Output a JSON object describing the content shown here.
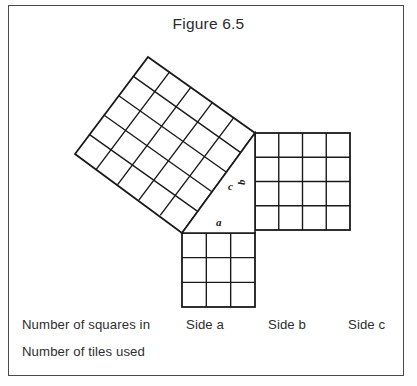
{
  "figure": {
    "title": "Figure 6.5",
    "border_color": "#4a4a4a",
    "line_color": "#1a1a1a",
    "background": "#ffffff"
  },
  "diagram": {
    "triangle_labels": {
      "a": "a",
      "b": "b",
      "c": "c"
    },
    "squares": [
      {
        "name": "square-a",
        "side_label": "a",
        "grid": 3,
        "tiles": 9,
        "orientation": "axis-aligned",
        "position": "below triangle"
      },
      {
        "name": "square-b",
        "side_label": "b",
        "grid": 4,
        "tiles": 16,
        "orientation": "axis-aligned",
        "position": "right of triangle"
      },
      {
        "name": "square-c",
        "side_label": "c",
        "grid": 5,
        "tiles": 25,
        "orientation": "tilted",
        "position": "upper left, on hypotenuse"
      }
    ]
  },
  "table": {
    "rows": [
      {
        "label": "Number of squares in"
      },
      {
        "label": "Number of tiles used"
      }
    ],
    "columns": [
      {
        "label": "Side a"
      },
      {
        "label": "Side b"
      },
      {
        "label": "Side c"
      }
    ]
  }
}
